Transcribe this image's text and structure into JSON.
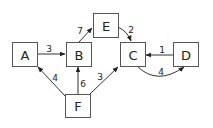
{
  "diagram": {
    "type": "directed-weighted-graph",
    "nodes": [
      {
        "id": "A",
        "label": "A"
      },
      {
        "id": "B",
        "label": "B"
      },
      {
        "id": "C",
        "label": "C"
      },
      {
        "id": "D",
        "label": "D"
      },
      {
        "id": "E",
        "label": "E"
      },
      {
        "id": "F",
        "label": "F"
      }
    ],
    "edges": [
      {
        "from": "A",
        "to": "B",
        "weight": "3"
      },
      {
        "from": "B",
        "to": "E",
        "weight": "7"
      },
      {
        "from": "E",
        "to": "C",
        "weight": "2"
      },
      {
        "from": "D",
        "to": "C",
        "weight": "1"
      },
      {
        "from": "C",
        "to": "D",
        "weight": "4"
      },
      {
        "from": "F",
        "to": "A",
        "weight": "4"
      },
      {
        "from": "F",
        "to": "B",
        "weight": "6"
      },
      {
        "from": "F",
        "to": "C",
        "weight": "3"
      }
    ]
  }
}
